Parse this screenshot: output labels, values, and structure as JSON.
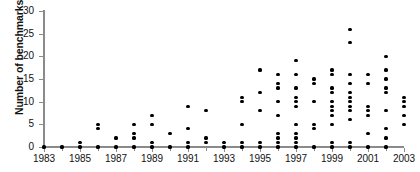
{
  "chart_data": {
    "type": "scatter",
    "title": "",
    "xlabel": "",
    "ylabel": "Number of benchmarks/targets",
    "xlim": [
      1983,
      2003
    ],
    "ylim": [
      0,
      30
    ],
    "yticks": [
      0,
      5,
      10,
      15,
      20,
      25,
      30
    ],
    "xticks": [
      1983,
      1985,
      1987,
      1989,
      1991,
      1993,
      1995,
      1997,
      1999,
      2001,
      2003
    ],
    "xtick_labels": [
      "1983",
      "1985",
      "1987",
      "1989",
      "1991",
      "1993",
      "1995",
      "1997",
      "1999",
      "2001",
      "2003"
    ],
    "ytick_labels": [
      "0",
      "5",
      "10",
      "15",
      "20",
      "25",
      "30"
    ],
    "grid": false,
    "legend": null,
    "marker": "filled-circle",
    "marker_color": "#000000",
    "axis_color": "#8a8a8a",
    "points": [
      {
        "x": 1983,
        "y": 0
      },
      {
        "x": 1984,
        "y": 0
      },
      {
        "x": 1985,
        "y": 0
      },
      {
        "x": 1985,
        "y": 1
      },
      {
        "x": 1986,
        "y": 0
      },
      {
        "x": 1986,
        "y": 4
      },
      {
        "x": 1986,
        "y": 5
      },
      {
        "x": 1987,
        "y": 0
      },
      {
        "x": 1987,
        "y": 2
      },
      {
        "x": 1988,
        "y": 0
      },
      {
        "x": 1988,
        "y": 2
      },
      {
        "x": 1988,
        "y": 3
      },
      {
        "x": 1988,
        "y": 5
      },
      {
        "x": 1989,
        "y": 0
      },
      {
        "x": 1989,
        "y": 1
      },
      {
        "x": 1989,
        "y": 5
      },
      {
        "x": 1989,
        "y": 7
      },
      {
        "x": 1990,
        "y": 0
      },
      {
        "x": 1990,
        "y": 3
      },
      {
        "x": 1991,
        "y": 0
      },
      {
        "x": 1991,
        "y": 1
      },
      {
        "x": 1991,
        "y": 4
      },
      {
        "x": 1991,
        "y": 9
      },
      {
        "x": 1992,
        "y": 1
      },
      {
        "x": 1992,
        "y": 2
      },
      {
        "x": 1992,
        "y": 8
      },
      {
        "x": 1993,
        "y": 0
      },
      {
        "x": 1993,
        "y": 1
      },
      {
        "x": 1994,
        "y": 0
      },
      {
        "x": 1994,
        "y": 1
      },
      {
        "x": 1994,
        "y": 5
      },
      {
        "x": 1994,
        "y": 10
      },
      {
        "x": 1994,
        "y": 11
      },
      {
        "x": 1995,
        "y": 0
      },
      {
        "x": 1995,
        "y": 1
      },
      {
        "x": 1995,
        "y": 8
      },
      {
        "x": 1995,
        "y": 12
      },
      {
        "x": 1995,
        "y": 17
      },
      {
        "x": 1996,
        "y": 0
      },
      {
        "x": 1996,
        "y": 1
      },
      {
        "x": 1996,
        "y": 2
      },
      {
        "x": 1996,
        "y": 3
      },
      {
        "x": 1996,
        "y": 7
      },
      {
        "x": 1996,
        "y": 10
      },
      {
        "x": 1996,
        "y": 13
      },
      {
        "x": 1996,
        "y": 14
      },
      {
        "x": 1996,
        "y": 16
      },
      {
        "x": 1997,
        "y": 0
      },
      {
        "x": 1997,
        "y": 1
      },
      {
        "x": 1997,
        "y": 2
      },
      {
        "x": 1997,
        "y": 3
      },
      {
        "x": 1997,
        "y": 5
      },
      {
        "x": 1997,
        "y": 9
      },
      {
        "x": 1997,
        "y": 10
      },
      {
        "x": 1997,
        "y": 11
      },
      {
        "x": 1997,
        "y": 13
      },
      {
        "x": 1997,
        "y": 16
      },
      {
        "x": 1997,
        "y": 19
      },
      {
        "x": 1998,
        "y": 0
      },
      {
        "x": 1998,
        "y": 4
      },
      {
        "x": 1998,
        "y": 5
      },
      {
        "x": 1998,
        "y": 10
      },
      {
        "x": 1998,
        "y": 14
      },
      {
        "x": 1998,
        "y": 15
      },
      {
        "x": 1999,
        "y": 0
      },
      {
        "x": 1999,
        "y": 1
      },
      {
        "x": 1999,
        "y": 5
      },
      {
        "x": 1999,
        "y": 7
      },
      {
        "x": 1999,
        "y": 8
      },
      {
        "x": 1999,
        "y": 9
      },
      {
        "x": 1999,
        "y": 10
      },
      {
        "x": 1999,
        "y": 12
      },
      {
        "x": 1999,
        "y": 13
      },
      {
        "x": 1999,
        "y": 16
      },
      {
        "x": 1999,
        "y": 17
      },
      {
        "x": 2000,
        "y": 0
      },
      {
        "x": 2000,
        "y": 1
      },
      {
        "x": 2000,
        "y": 6
      },
      {
        "x": 2000,
        "y": 8
      },
      {
        "x": 2000,
        "y": 9
      },
      {
        "x": 2000,
        "y": 10
      },
      {
        "x": 2000,
        "y": 11
      },
      {
        "x": 2000,
        "y": 12
      },
      {
        "x": 2000,
        "y": 14
      },
      {
        "x": 2000,
        "y": 16
      },
      {
        "x": 2000,
        "y": 23
      },
      {
        "x": 2000,
        "y": 26
      },
      {
        "x": 2001,
        "y": 0
      },
      {
        "x": 2001,
        "y": 3
      },
      {
        "x": 2001,
        "y": 7
      },
      {
        "x": 2001,
        "y": 8
      },
      {
        "x": 2001,
        "y": 9
      },
      {
        "x": 2001,
        "y": 14
      },
      {
        "x": 2001,
        "y": 16
      },
      {
        "x": 2002,
        "y": 0
      },
      {
        "x": 2002,
        "y": 2
      },
      {
        "x": 2002,
        "y": 4
      },
      {
        "x": 2002,
        "y": 8
      },
      {
        "x": 2002,
        "y": 12
      },
      {
        "x": 2002,
        "y": 13
      },
      {
        "x": 2002,
        "y": 15
      },
      {
        "x": 2002,
        "y": 17
      },
      {
        "x": 2002,
        "y": 20
      },
      {
        "x": 2003,
        "y": 5
      },
      {
        "x": 2003,
        "y": 7
      },
      {
        "x": 2003,
        "y": 9
      },
      {
        "x": 2003,
        "y": 10
      },
      {
        "x": 2003,
        "y": 11
      }
    ]
  }
}
